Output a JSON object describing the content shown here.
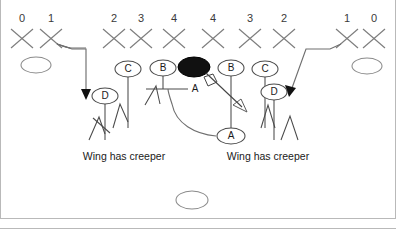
{
  "diagram": {
    "colors": {
      "xmark": "#7d7d7d",
      "player_outline": "#4a4a4a",
      "ball_fill": "#111111",
      "route": "#6f6f6f",
      "frame": "#b9b9b9",
      "text": "#1a1a1a"
    },
    "gap_numbers": [
      {
        "label": "0",
        "x": 22,
        "y": 18
      },
      {
        "label": "1",
        "x": 51,
        "y": 18
      },
      {
        "label": "2",
        "x": 114,
        "y": 18
      },
      {
        "label": "3",
        "x": 141,
        "y": 18
      },
      {
        "label": "4",
        "x": 174,
        "y": 18
      },
      {
        "label": "4",
        "x": 213,
        "y": 18
      },
      {
        "label": "3",
        "x": 250,
        "y": 18
      },
      {
        "label": "2",
        "x": 284,
        "y": 18
      },
      {
        "label": "1",
        "x": 347,
        "y": 18
      },
      {
        "label": "0",
        "x": 374,
        "y": 18
      }
    ],
    "defenders": [
      {
        "name": "defender-x-0-left",
        "x": 22,
        "y": 38
      },
      {
        "name": "defender-x-1-left",
        "x": 51,
        "y": 38
      },
      {
        "name": "defender-x-2-left",
        "x": 114,
        "y": 38
      },
      {
        "name": "defender-x-3-left",
        "x": 141,
        "y": 38
      },
      {
        "name": "defender-x-4-left",
        "x": 174,
        "y": 38
      },
      {
        "name": "defender-x-4-right",
        "x": 213,
        "y": 38
      },
      {
        "name": "defender-x-3-right",
        "x": 250,
        "y": 38
      },
      {
        "name": "defender-x-2-right",
        "x": 284,
        "y": 38
      },
      {
        "name": "defender-x-1-right",
        "x": 347,
        "y": 38
      },
      {
        "name": "defender-x-0-right",
        "x": 374,
        "y": 38
      }
    ],
    "empty_backs": [
      {
        "name": "back-oval-left",
        "x": 36,
        "y": 65,
        "rx": 15,
        "ry": 8
      },
      {
        "name": "back-oval-right",
        "x": 367,
        "y": 66,
        "rx": 15,
        "ry": 8
      },
      {
        "name": "back-oval-deep",
        "x": 192,
        "y": 200,
        "rx": 16,
        "ry": 9
      }
    ],
    "lettered_players": [
      {
        "letter": "C",
        "name": "player-c-left",
        "x": 128,
        "y": 69
      },
      {
        "letter": "B",
        "name": "player-b-left",
        "x": 163,
        "y": 68
      },
      {
        "letter": "B",
        "name": "player-b-right",
        "x": 231,
        "y": 68
      },
      {
        "letter": "C",
        "name": "player-c-right",
        "x": 265,
        "y": 69
      },
      {
        "letter": "D",
        "name": "player-d-left",
        "x": 105,
        "y": 96
      },
      {
        "letter": "D",
        "name": "player-d-right",
        "x": 274,
        "y": 92
      },
      {
        "letter": "A",
        "name": "player-a-back",
        "x": 231,
        "y": 136
      }
    ],
    "center": {
      "name": "center-ball",
      "letter": "A",
      "x": 194,
      "y": 67,
      "rx": 16,
      "ry": 10,
      "label_x": 195,
      "label_y": 88
    },
    "notes": [
      {
        "text": "Wing has creeper",
        "name": "note-left",
        "x": 124,
        "y": 157
      },
      {
        "text": "Wing has creeper",
        "name": "note-right",
        "x": 268,
        "y": 157
      }
    ]
  }
}
